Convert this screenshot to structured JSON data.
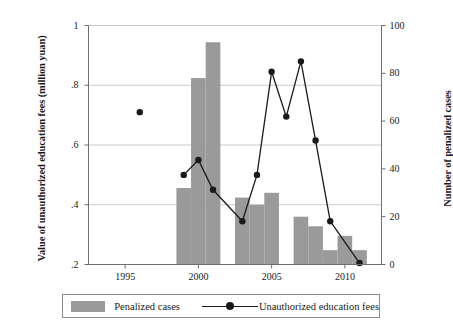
{
  "chart_data": {
    "type": "bar",
    "title": "",
    "xlabel": "",
    "ylabel": "Value of unauthorized education fees (million yuan)",
    "y2label": "Number of penalized cases",
    "xlim": [
      1992.5,
      2012.5
    ],
    "ylim": [
      0.2,
      1.0
    ],
    "y2lim": [
      0,
      100
    ],
    "grid": true,
    "legend_position": "bottom",
    "x_ticks": [
      1995,
      2000,
      2005,
      2010
    ],
    "x_tick_labels": [
      "1995",
      "2000",
      "2005",
      "2010"
    ],
    "y_ticks": [
      0.2,
      0.4,
      0.6,
      0.8,
      1.0
    ],
    "y_tick_labels": [
      ".2",
      ".4",
      ".6",
      ".8",
      "1"
    ],
    "y2_ticks": [
      0,
      20,
      40,
      60,
      80,
      100
    ],
    "y2_tick_labels": [
      "0",
      "20",
      "40",
      "60",
      "80",
      "100"
    ],
    "series": [
      {
        "name": "Penalized cases",
        "type": "bar",
        "axis": "right",
        "color": "#9a9a9a",
        "x": [
          1999,
          2000,
          2001,
          2003,
          2004,
          2005,
          2007,
          2008,
          2009,
          2010,
          2011
        ],
        "values": [
          32,
          78,
          93,
          28,
          25,
          30,
          20,
          16,
          6,
          12,
          6
        ]
      },
      {
        "name": "Unauthorized education fees",
        "type": "line",
        "axis": "left",
        "color": "#1a1a1a",
        "x": [
          1996,
          1999,
          2000,
          2001,
          2003,
          2004,
          2005,
          2006,
          2007,
          2008,
          2009
        ],
        "values": [
          0.71,
          0.5,
          0.55,
          0.45,
          0.345,
          0.5,
          0.845,
          0.695,
          0.88,
          0.615,
          0.345
        ],
        "values_right_axis": [
          64,
          38,
          44,
          31,
          18,
          38,
          81,
          62,
          85,
          52,
          18
        ],
        "connected_from_index": 1
      },
      {
        "name": "Unauthorized education fees",
        "type": "line-tail",
        "axis": "left",
        "color": "#1a1a1a",
        "x": [
          2009,
          2011
        ],
        "values": [
          0.345,
          0.205
        ]
      }
    ]
  },
  "legend": {
    "bar_label": "Penalized cases",
    "line_label": "Unauthorized education fees"
  },
  "axis_titles": {
    "left": "Value of unauthorized education fees (million yuan)",
    "right": "Number of penalized cases"
  },
  "icons": {
    "legend_bar_swatch": "bar-swatch-icon",
    "legend_line_marker": "line-marker-icon"
  },
  "colors": {
    "bar_fill": "#9a9a9a",
    "line": "#1a1a1a",
    "grid": "#bfbfbf",
    "axis": "#6e6e6e",
    "background": "#ffffff"
  }
}
